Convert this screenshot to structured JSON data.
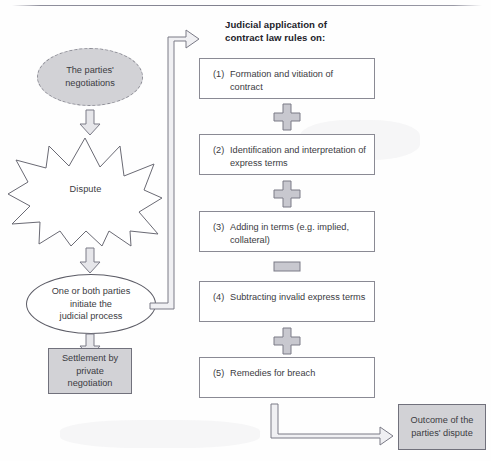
{
  "diagram": {
    "title_lines": [
      "Judicial application of",
      "contract law rules on:"
    ],
    "left_flow": {
      "negotiations": "The parties'\nnegotiations",
      "dispute": "Dispute",
      "initiate": "One or both parties\ninitiate the\njudicial process",
      "settlement": "Settlement by\nprivate\nnegotiation"
    },
    "rules": [
      {
        "num": "(1)",
        "text": "Formation and vitiation of contract"
      },
      {
        "num": "(2)",
        "text": "Identification and interpretation of express terms"
      },
      {
        "num": "(3)",
        "text": "Adding in terms (e.g. implied, collateral)"
      },
      {
        "num": "(4)",
        "text": "Subtracting invalid express terms"
      },
      {
        "num": "(5)",
        "text": "Remedies for breach"
      }
    ],
    "operators": [
      "plus",
      "plus",
      "minus",
      "plus"
    ],
    "outcome": "Outcome of the\nparties' dispute",
    "colors": {
      "shape_fill_grey": "#d2d2d6",
      "outline_grey": "#8a8a94",
      "text": "#3b3b42",
      "heading": "#23232a",
      "arrow_fill": "#e6e6ea",
      "arrow_stroke": "#7a7a86"
    }
  }
}
